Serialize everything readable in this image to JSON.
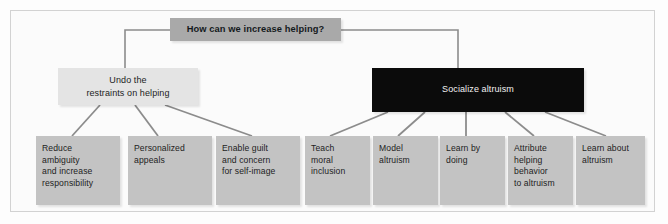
{
  "figure": {
    "title": "How can we increase helping?",
    "colors": {
      "root_box": "#a9a9a9",
      "branch_light_box": "#e4e4e4",
      "branch_dark_box": "#0b0b0b",
      "leaf_box": "#c3c3c3",
      "connector_line": "#8c8c8c",
      "frame_border": "#d2d2d2",
      "background": "#fbfbfb",
      "text_dark": "#1d1d1d",
      "text_light": "#f2f2f2"
    }
  },
  "root": {
    "label": "How can we increase helping?"
  },
  "branches": [
    {
      "id": "undo-restraints",
      "lines": [
        "Undo the",
        "restraints on helping"
      ],
      "style": "light"
    },
    {
      "id": "socialize-altruism",
      "lines": [
        "Socialize altruism"
      ],
      "style": "dark"
    }
  ],
  "leaves": [
    {
      "id": "reduce-ambiguity",
      "parent": "undo-restraints",
      "lines": [
        "Reduce",
        "ambiguity",
        "and increase",
        "responsibility"
      ]
    },
    {
      "id": "personalized-appeals",
      "parent": "undo-restraints",
      "lines": [
        "Personalized",
        "appeals"
      ]
    },
    {
      "id": "enable-guilt",
      "parent": "undo-restraints",
      "lines": [
        "Enable guilt",
        "and concern",
        "for self-image"
      ]
    },
    {
      "id": "teach-moral-inclusion",
      "parent": "socialize-altruism",
      "lines": [
        "Teach",
        "moral",
        "inclusion"
      ]
    },
    {
      "id": "model-altruism",
      "parent": "socialize-altruism",
      "lines": [
        "Model",
        "altruism"
      ]
    },
    {
      "id": "learn-by-doing",
      "parent": "socialize-altruism",
      "lines": [
        "Learn by",
        "doing"
      ]
    },
    {
      "id": "attribute-helping",
      "parent": "socialize-altruism",
      "lines": [
        "Attribute",
        "helping",
        "behavior",
        "to altruism"
      ]
    },
    {
      "id": "learn-about-altruism",
      "parent": "socialize-altruism",
      "lines": [
        "Learn about",
        "altruism"
      ]
    }
  ]
}
